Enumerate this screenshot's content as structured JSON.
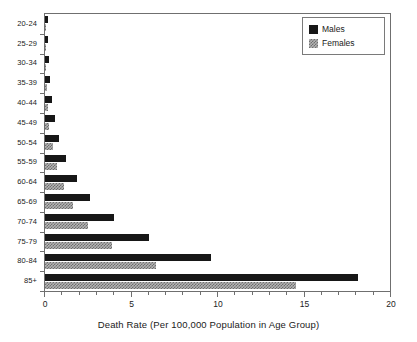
{
  "chart_data": {
    "type": "bar",
    "orientation": "horizontal",
    "title": "",
    "subtitle": "",
    "xlabel": "Death Rate (Per 100,000 Population in Age Group)",
    "ylabel": "",
    "xlim": [
      0,
      20
    ],
    "ylim": null,
    "grid": false,
    "xticks": [
      0,
      5,
      10,
      15,
      20
    ],
    "xtick_labels": [
      "0",
      "5",
      "10",
      "15",
      "20"
    ],
    "x_minor_tick_interval": 1,
    "categories": [
      "20-24",
      "25-29",
      "30-34",
      "35-39",
      "40-44",
      "45-49",
      "50-54",
      "55-59",
      "60-64",
      "65-69",
      "70-74",
      "75-79",
      "80-84",
      "85+"
    ],
    "legend": {
      "position": "top-right",
      "entries": [
        {
          "name": "Males",
          "swatch": "solid-black"
        },
        {
          "name": "Females",
          "swatch": "hatched-gray"
        }
      ]
    },
    "series": [
      {
        "name": "Males",
        "color": "#171717",
        "values": [
          0.15,
          0.2,
          0.25,
          0.3,
          0.4,
          0.55,
          0.8,
          1.2,
          1.85,
          2.6,
          4.0,
          6.0,
          9.6,
          18.1
        ]
      },
      {
        "name": "Females",
        "color": "#b4b4b4",
        "values": [
          0.05,
          0.05,
          0.08,
          0.1,
          0.15,
          0.25,
          0.45,
          0.7,
          1.1,
          1.6,
          2.5,
          3.9,
          6.4,
          14.5
        ]
      }
    ]
  },
  "colors": {
    "males": "#171717",
    "females": "#b4b4b4",
    "axis": "#6f6f6f",
    "background": "#ffffff",
    "text": "#1a1a1a"
  }
}
